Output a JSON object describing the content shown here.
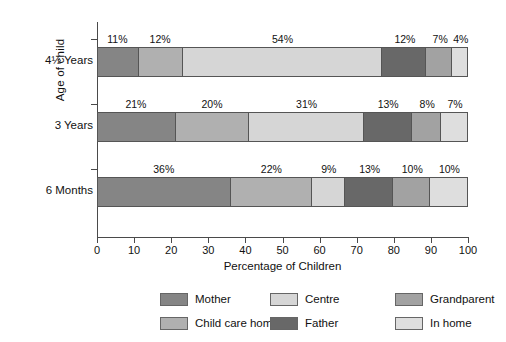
{
  "chart_data": {
    "type": "bar",
    "orientation": "horizontal",
    "stacked": true,
    "title": "",
    "xlabel": "Percentage of Children",
    "ylabel": "Age of child",
    "xlim": [
      0,
      100
    ],
    "xticks": [
      "0",
      "10",
      "20",
      "30",
      "40",
      "50",
      "60",
      "70",
      "80",
      "90",
      "100"
    ],
    "grid": false,
    "legend_position": "bottom",
    "categories": [
      "4½ Years",
      "3 Years",
      "6 Months"
    ],
    "series": [
      {
        "name": "Mother",
        "color": "#858585",
        "values": [
          11,
          21,
          36
        ]
      },
      {
        "name": "Child care home",
        "color": "#b0b0b0",
        "values": [
          12,
          20,
          22
        ]
      },
      {
        "name": "Centre",
        "color": "#d6d6d6",
        "values": [
          54,
          31,
          9
        ]
      },
      {
        "name": "Father",
        "color": "#686868",
        "values": [
          12,
          13,
          13
        ]
      },
      {
        "name": "Grandparent",
        "color": "#a2a2a2",
        "values": [
          7,
          8,
          10
        ]
      },
      {
        "name": "In home",
        "color": "#dedede",
        "values": [
          4,
          7,
          10
        ]
      }
    ],
    "data_labels": {
      "4½ Years": [
        "11%",
        "12%",
        "54%",
        "12%",
        "7%",
        "4%"
      ],
      "3 Years": [
        "21%",
        "20%",
        "31%",
        "13%",
        "8%",
        "7%"
      ],
      "6 Months": [
        "36%",
        "22%",
        "9%",
        "13%",
        "10%",
        "10%"
      ]
    }
  },
  "axis": {
    "y_title": "Age of child",
    "x_title": "Percentage of Children"
  }
}
